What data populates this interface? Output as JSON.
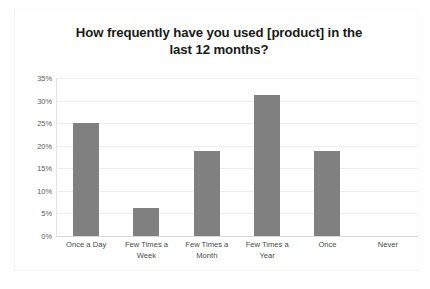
{
  "chart_data": {
    "type": "bar",
    "title": "How frequently have you used [product] in the last 12 months?",
    "title_line1": "How frequently have you used [product] in the",
    "title_line2": "last 12 months?",
    "categories": [
      "Once a Day",
      "Few Times a Week",
      "Few Times a Month",
      "Few Times a Year",
      "Once",
      "Never"
    ],
    "category_lines": [
      [
        "Once a Day"
      ],
      [
        "Few Times a",
        "Week"
      ],
      [
        "Few Times a",
        "Month"
      ],
      [
        "Few Times a",
        "Year"
      ],
      [
        "Once"
      ],
      [
        "Never"
      ]
    ],
    "values": [
      25.0,
      6.3,
      18.8,
      31.3,
      18.8,
      0
    ],
    "value_labels": [
      "25%",
      "6.3%",
      "18.8%",
      "31.3%",
      "18.8%",
      "0%"
    ],
    "xlabel": "",
    "ylabel": "",
    "ylim": [
      0,
      35
    ],
    "ytick_values": [
      0,
      5,
      10,
      15,
      20,
      25,
      30,
      35
    ],
    "ytick_labels": [
      "0%",
      "5%",
      "10%",
      "15%",
      "20%",
      "25%",
      "30%",
      "35%"
    ],
    "grid": true,
    "legend": false,
    "series_color": "#808080",
    "gridline_color": "#ededed",
    "axis_color": "#e3e3e3",
    "title_color": "#1a1a1a",
    "tick_label_color": "#595959",
    "background": "#ffffff"
  }
}
